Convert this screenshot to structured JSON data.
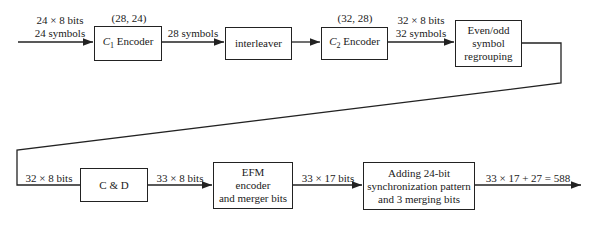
{
  "diagram": {
    "row1": {
      "input_label_line1": "24 × 8 bits",
      "input_label_line2": "24 symbols",
      "c1_params": "(28, 24)",
      "c1_encoder": {
        "symbol": "C",
        "subscript": "1",
        "text": "Encoder"
      },
      "c1_out_label": "28 symbols",
      "interleaver": "interleaver",
      "c2_params": "(32, 28)",
      "c2_encoder": {
        "symbol": "C",
        "subscript": "2",
        "text": "Encoder"
      },
      "c2_out_label_line1": "32 × 8 bits",
      "c2_out_label_line2": "32 symbols",
      "regroup": {
        "line1": "Even/odd",
        "line2": "symbol",
        "line3": "regrouping"
      }
    },
    "row2": {
      "input_label": "32 × 8 bits",
      "cd": "C & D",
      "cd_out_label": "33 × 8 bits",
      "efm": {
        "line1": "EFM",
        "line2": "encoder",
        "line3": "and merger bits"
      },
      "efm_out_label": "33 × 17 bits",
      "sync": {
        "line1": "Adding 24-bit",
        "line2": "synchronization pattern",
        "line3": "and 3 merging bits"
      },
      "output_label": "33 × 17 + 27 = 588"
    }
  }
}
